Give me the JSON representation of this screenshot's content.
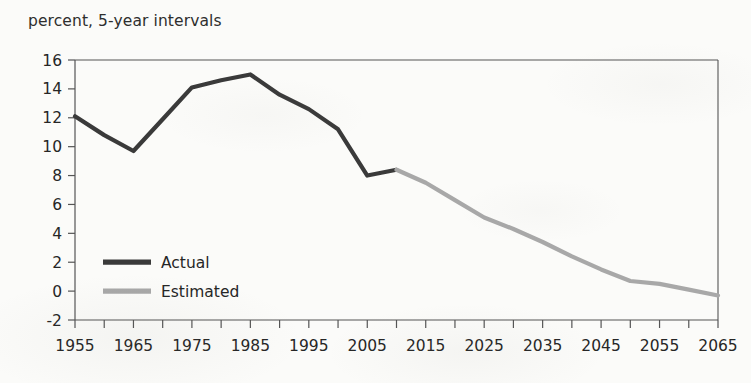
{
  "title": "percent, 5-year intervals",
  "colors": {
    "actual": "#3a3a3a",
    "estimated": "#a8a8a8",
    "axis": "#555555",
    "text": "#262626",
    "background": "#fbfbf9"
  },
  "legend": {
    "position": "inside-left",
    "entries": [
      {
        "label": "Actual",
        "color": "#3a3a3a"
      },
      {
        "label": "Estimated",
        "color": "#a8a8a8"
      }
    ]
  },
  "axes": {
    "y_label": "percent, 5-year intervals",
    "y_ticks": [
      "16",
      "14",
      "12",
      "10",
      "8",
      "6",
      "4",
      "2",
      "0",
      "-2"
    ],
    "x_ticks": [
      "1955",
      "1965",
      "1975",
      "1985",
      "1995",
      "2005",
      "2015",
      "2025",
      "2035",
      "2045",
      "2055",
      "2065"
    ]
  },
  "chart_data": {
    "type": "line",
    "title": "percent, 5-year intervals",
    "xlabel": "",
    "ylabel": "percent",
    "xlim": [
      1955,
      2065
    ],
    "ylim": [
      -2,
      16
    ],
    "ytick_step": 2,
    "xtick_step": 5,
    "xtick_label_step": 10,
    "grid": false,
    "legend_position": "inside-left",
    "series": [
      {
        "name": "Actual",
        "color": "#3a3a3a",
        "x": [
          1955,
          1960,
          1965,
          1970,
          1975,
          1980,
          1985,
          1990,
          1995,
          2000,
          2005,
          2010
        ],
        "values": [
          12.1,
          10.8,
          9.7,
          11.9,
          14.1,
          14.6,
          15.0,
          13.6,
          12.6,
          11.2,
          8.0,
          8.4
        ]
      },
      {
        "name": "Estimated",
        "color": "#a8a8a8",
        "x": [
          2010,
          2015,
          2020,
          2025,
          2030,
          2035,
          2040,
          2045,
          2050,
          2055,
          2060,
          2065
        ],
        "values": [
          8.4,
          7.5,
          6.3,
          5.1,
          4.3,
          3.4,
          2.4,
          1.5,
          0.7,
          0.5,
          0.1,
          -0.3
        ]
      }
    ]
  }
}
